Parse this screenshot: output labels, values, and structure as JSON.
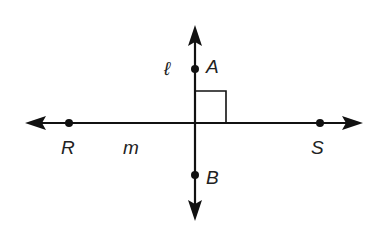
{
  "diagram": {
    "type": "perpendicular-lines",
    "lines": [
      {
        "name": "l",
        "label": "ℓ",
        "orientation": "vertical"
      },
      {
        "name": "m",
        "label": "m",
        "orientation": "horizontal"
      }
    ],
    "points": [
      {
        "name": "A",
        "label": "A",
        "on_line": "ℓ"
      },
      {
        "name": "B",
        "label": "B",
        "on_line": "ℓ"
      },
      {
        "name": "R",
        "label": "R",
        "on_line": "m"
      },
      {
        "name": "S",
        "label": "S",
        "on_line": "m"
      }
    ],
    "right_angle_marker": true,
    "colors": {
      "stroke": "#111111",
      "text": "#222222",
      "background": "#ffffff"
    }
  }
}
